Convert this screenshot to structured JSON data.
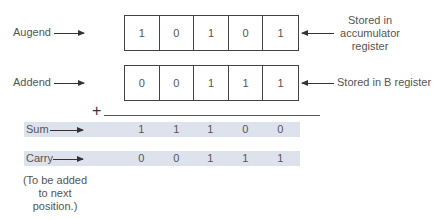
{
  "diagram": {
    "rows": {
      "augend": {
        "label": "Augend",
        "bits": [
          "1",
          "0",
          "1",
          "0",
          "1"
        ],
        "annotation": [
          "Stored in",
          "accumulator",
          "register"
        ]
      },
      "addend": {
        "label": "Addend",
        "bits": [
          "0",
          "0",
          "1",
          "1",
          "1"
        ],
        "annotation": "Stored in B register"
      },
      "operator": "+",
      "sum": {
        "label": "Sum",
        "bits": [
          "1",
          "1",
          "1",
          "0",
          "0"
        ]
      },
      "carry": {
        "label": "Carry",
        "bits": [
          "0",
          "0",
          "1",
          "1",
          "1"
        ]
      },
      "carry_note": [
        "(To be added",
        "to next",
        "position.)"
      ]
    },
    "colors": {
      "band": "#dde2ec",
      "border": "#444444",
      "text": "#555555"
    }
  }
}
